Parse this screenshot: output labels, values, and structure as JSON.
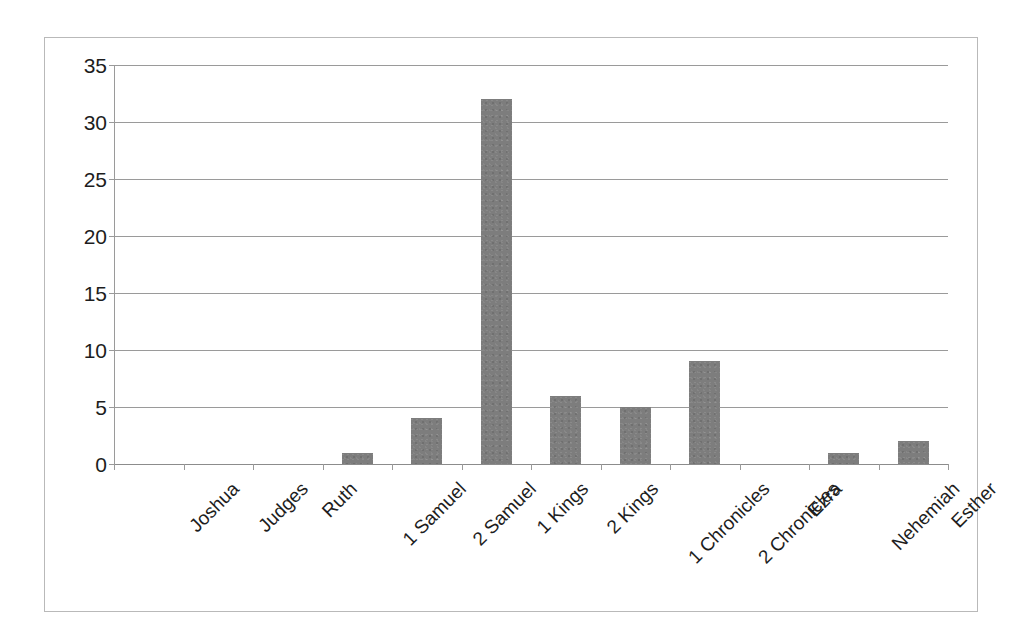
{
  "chart_data": {
    "type": "bar",
    "title": "",
    "subtitle": "",
    "xlabel": "",
    "ylabel": "",
    "categories": [
      "Joshua",
      "Judges",
      "Ruth",
      "1 Samuel",
      "2 Samuel",
      "1 Kings",
      "2 Kings",
      "1 Chronicles",
      "2 Chronicles",
      "Ezra",
      "Nehemiah",
      "Esther"
    ],
    "values": [
      0,
      0,
      0,
      1,
      4,
      32,
      6,
      5,
      9,
      0,
      1,
      2
    ],
    "ylim": [
      0,
      35
    ],
    "y_ticks": [
      0,
      5,
      10,
      15,
      20,
      25,
      30,
      35
    ],
    "y_tick_labels": [
      "0",
      "5",
      "10",
      "15",
      "20",
      "25",
      "30",
      "35"
    ],
    "grid": true,
    "grid_axis": "y",
    "legend": false,
    "legend_position": "none",
    "bar_color": "#7d7d7d",
    "grid_color": "#9a9a9a",
    "axis_color": "#9a9a9a",
    "frame_color": "#b9b9b9",
    "background_color": "#ffffff",
    "text_color": "#1d1d1d",
    "x_label_rotation": -45
  }
}
